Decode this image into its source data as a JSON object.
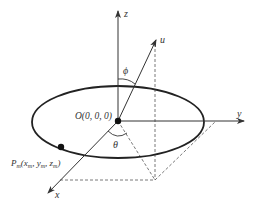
{
  "diagram": {
    "axes": {
      "x": "x",
      "y": "y",
      "z": "z",
      "u": "u"
    },
    "origin_label": "O(0, 0, 0)",
    "point_label_main": "P",
    "point_label_sub": "m",
    "point_coords_open": "(",
    "point_x": "x",
    "point_x_sub": "m",
    "point_y": ", y",
    "point_y_sub": "m",
    "point_z": ", z",
    "point_z_sub": "m",
    "point_close": ")",
    "angles": {
      "phi": "ϕ",
      "theta": "θ"
    },
    "colors": {
      "line": "#333333",
      "dash": "#555555"
    }
  }
}
